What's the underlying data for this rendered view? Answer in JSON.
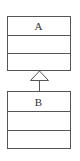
{
  "diagram": {
    "type": "uml-class-inheritance",
    "classes": [
      {
        "name": "A",
        "compartments": 3
      },
      {
        "name": "B",
        "compartments": 3
      }
    ],
    "relationship": {
      "from": "B",
      "to": "A",
      "kind": "generalization"
    },
    "colors": {
      "stroke": "#555555",
      "background": "#ffffff"
    }
  }
}
